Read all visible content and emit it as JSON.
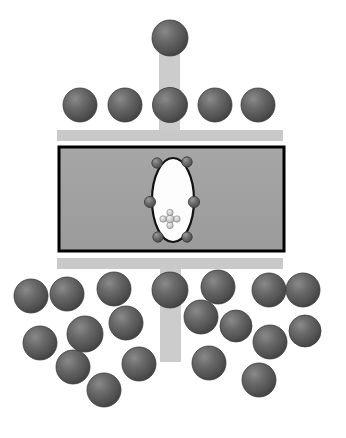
{
  "figure": {
    "canvas": {
      "width": 346,
      "height": 438,
      "background": "#ffffff"
    },
    "colors": {
      "background": "#ffffff",
      "sphere_fill": "#555555",
      "sphere_highlight": "#7e7e7e",
      "sphere_rim": "#3b3b3b",
      "bar_fill": "#c9c9c9",
      "stem_fill": "#cccccc",
      "chamber_fill": "#a0a0a0",
      "chamber_border": "#000000",
      "vesicle_fill": "#fdfdfd",
      "vesicle_border": "#111111",
      "small_sphere_fill": "#6a6a6a",
      "cluster_fill": "#d2d2d2"
    }
  },
  "elements": {
    "top_stem": {
      "label": "upper vertical stem",
      "x": 159,
      "y": 38,
      "width": 21,
      "height": 98
    },
    "bottom_stem": {
      "label": "lower vertical stem",
      "x": 160,
      "y": 258,
      "width": 21,
      "height": 104
    },
    "top_bar": {
      "label": "upper horizontal bar",
      "x": 57,
      "y": 130,
      "width": 226,
      "height": 11
    },
    "bottom_bar": {
      "label": "lower horizontal bar",
      "x": 57,
      "y": 258,
      "width": 226,
      "height": 11
    },
    "chamber": {
      "label": "central rectangular chamber",
      "x": 59,
      "y": 147,
      "width": 225,
      "height": 104,
      "border_width": 3
    },
    "vesicle": {
      "label": "central white vesicle",
      "cx": 173,
      "cy": 200,
      "rx": 21,
      "ry": 42,
      "border_width": 2.2
    },
    "vesicle_nodes": [
      {
        "label": "vesicle-node-top-left",
        "cx": 157,
        "cy": 163,
        "r": 5.2
      },
      {
        "label": "vesicle-node-top-right",
        "cx": 187,
        "cy": 162,
        "r": 5.2
      },
      {
        "label": "vesicle-node-mid-left",
        "cx": 150,
        "cy": 202,
        "r": 5.6
      },
      {
        "label": "vesicle-node-mid-right",
        "cx": 194,
        "cy": 202,
        "r": 5.6
      },
      {
        "label": "vesicle-node-bottom-left",
        "cx": 158,
        "cy": 237,
        "r": 5.2
      },
      {
        "label": "vesicle-node-bottom-right",
        "cx": 187,
        "cy": 237,
        "r": 5.2
      }
    ],
    "inner_cluster": {
      "label": "inner particle cluster",
      "cx": 170,
      "cy": 219,
      "nodes": [
        {
          "label": "cluster-center",
          "dx": 0,
          "dy": 0,
          "r": 4.0
        },
        {
          "label": "cluster-top",
          "dx": 0,
          "dy": -6.5,
          "r": 3.2
        },
        {
          "label": "cluster-bottom",
          "dx": 0,
          "dy": 6.5,
          "r": 3.2
        },
        {
          "label": "cluster-left",
          "dx": -7.0,
          "dy": 0,
          "r": 3.2
        },
        {
          "label": "cluster-right",
          "dx": 7.0,
          "dy": 0,
          "r": 3.2
        }
      ]
    },
    "spheres_top": [
      {
        "label": "apex-sphere",
        "cx": 170,
        "cy": 38,
        "r": 18
      }
    ],
    "spheres_row": [
      {
        "label": "row-sphere-1",
        "cx": 80,
        "cy": 105,
        "r": 17
      },
      {
        "label": "row-sphere-2",
        "cx": 125,
        "cy": 105,
        "r": 17
      },
      {
        "label": "row-sphere-3",
        "cx": 170,
        "cy": 105,
        "r": 17.5
      },
      {
        "label": "row-sphere-4",
        "cx": 215,
        "cy": 105,
        "r": 17
      },
      {
        "label": "row-sphere-5",
        "cx": 258,
        "cy": 105,
        "r": 17
      }
    ],
    "spheres_bottom": [
      {
        "label": "bottom-sphere-1",
        "cx": 31,
        "cy": 296,
        "r": 17
      },
      {
        "label": "bottom-sphere-2",
        "cx": 67,
        "cy": 294,
        "r": 17
      },
      {
        "label": "bottom-sphere-3",
        "cx": 114,
        "cy": 289,
        "r": 17
      },
      {
        "label": "bottom-sphere-4",
        "cx": 170,
        "cy": 290,
        "r": 18
      },
      {
        "label": "bottom-sphere-5",
        "cx": 218,
        "cy": 287,
        "r": 17
      },
      {
        "label": "bottom-sphere-6",
        "cx": 269,
        "cy": 290,
        "r": 17
      },
      {
        "label": "bottom-sphere-7",
        "cx": 303,
        "cy": 290,
        "r": 17
      },
      {
        "label": "bottom-sphere-8",
        "cx": 126,
        "cy": 323,
        "r": 17
      },
      {
        "label": "bottom-sphere-9",
        "cx": 85,
        "cy": 334,
        "r": 18
      },
      {
        "label": "bottom-sphere-10",
        "cx": 40,
        "cy": 343,
        "r": 17
      },
      {
        "label": "bottom-sphere-11",
        "cx": 201,
        "cy": 317,
        "r": 17
      },
      {
        "label": "bottom-sphere-12",
        "cx": 236,
        "cy": 326,
        "r": 16
      },
      {
        "label": "bottom-sphere-13",
        "cx": 305,
        "cy": 331,
        "r": 16
      },
      {
        "label": "bottom-sphere-14",
        "cx": 270,
        "cy": 342,
        "r": 17
      },
      {
        "label": "bottom-sphere-15",
        "cx": 73,
        "cy": 367,
        "r": 17
      },
      {
        "label": "bottom-sphere-16",
        "cx": 139,
        "cy": 364,
        "r": 17
      },
      {
        "label": "bottom-sphere-17",
        "cx": 209,
        "cy": 363,
        "r": 17
      },
      {
        "label": "bottom-sphere-18",
        "cx": 104,
        "cy": 390,
        "r": 17
      },
      {
        "label": "bottom-sphere-19",
        "cx": 259,
        "cy": 380,
        "r": 17
      }
    ]
  }
}
